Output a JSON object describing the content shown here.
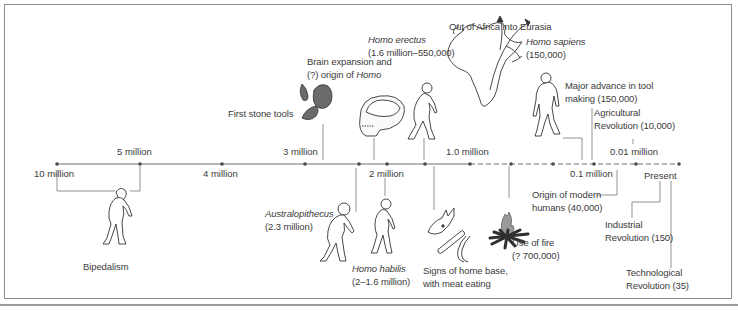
{
  "diagram": {
    "type": "timeline",
    "title": "",
    "axis": {
      "ticks": [
        {
          "label": "10 million",
          "x": 57
        },
        {
          "label": "5 million",
          "x": 140
        },
        {
          "label": "4 million",
          "x": 222
        },
        {
          "label": "3 million",
          "x": 305
        },
        {
          "label": "2 million",
          "x": 387
        },
        {
          "label": "1.0 million",
          "x": 470
        },
        {
          "label": "0.1 million",
          "x": 594
        },
        {
          "label": "0.01 million",
          "x": 636
        },
        {
          "label": "Present",
          "x": 679
        }
      ],
      "solid_until_x": 470,
      "dashed_from_x": 470
    },
    "events": [
      {
        "id": "bipedalism",
        "label": "Bipedalism",
        "icon": "walking-ape-icon"
      },
      {
        "id": "first-stone-tools",
        "label": "First stone tools",
        "icon": "stone-tools-icon"
      },
      {
        "id": "brain-expansion",
        "line1": "Brain expansion and",
        "line2_prefix": "(?) origin of ",
        "line2_italic": "Homo",
        "icon": "skull-icon"
      },
      {
        "id": "homo-erectus",
        "name": "Homo erectus",
        "dates": "(1.6 million–550,000)",
        "icon": "homo-erectus-figure-icon"
      },
      {
        "id": "out-of-africa",
        "label": "Out of Africa into Eurasia",
        "icon": "africa-map-icon"
      },
      {
        "id": "homo-sapiens",
        "name": "Homo sapiens",
        "dates": "(150,000)",
        "icon": "homo-sapiens-figure-icon"
      },
      {
        "id": "tool-advance",
        "line1": "Major advance in tool",
        "line2": "making (150,000)"
      },
      {
        "id": "agricultural",
        "line1": "Agricultural",
        "line2": "Revolution (10,000)"
      },
      {
        "id": "australopithecus",
        "name": "Australopithecus",
        "dates": "(2.3 million)",
        "icon": "australopithecus-figure-icon"
      },
      {
        "id": "homo-habilis",
        "name": "Homo habilis",
        "dates": "(2–1.6 million)",
        "icon": "homo-habilis-figure-icon"
      },
      {
        "id": "home-base",
        "line1": "Signs of home base,",
        "line2": "with meat eating",
        "icon": "animal-skull-bones-icon"
      },
      {
        "id": "fire",
        "line1": "Use of fire",
        "line2": "(? 700,000)",
        "icon": "campfire-icon"
      },
      {
        "id": "modern-humans",
        "line1": "Origin of modern",
        "line2": "humans (40,000)"
      },
      {
        "id": "industrial",
        "line1": "Industrial",
        "line2": "Revolution (150)"
      },
      {
        "id": "technological",
        "line1": "Technological",
        "line2": "Revolution (35)"
      }
    ],
    "colors": {
      "line": "#6e6e6e",
      "dot": "#4a4a4a",
      "text": "#3b3b3b",
      "stone": "#6b6b6b",
      "fire_flame": "#9a9a9a",
      "fire_logs": "#2f2f2f",
      "border": "#8a8a8a"
    }
  }
}
